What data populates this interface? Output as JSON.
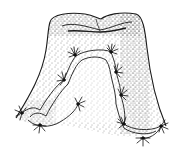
{
  "figure": {
    "colors": {
      "ink": "#1a1a1a",
      "background": "#ffffff",
      "stipple": "#333333"
    },
    "tufts": [
      {
        "x": 75,
        "y": 55
      },
      {
        "x": 111,
        "y": 52
      },
      {
        "x": 64,
        "y": 80
      },
      {
        "x": 116,
        "y": 72
      },
      {
        "x": 78,
        "y": 104
      },
      {
        "x": 121,
        "y": 95
      },
      {
        "x": 22,
        "y": 113
      },
      {
        "x": 40,
        "y": 125
      },
      {
        "x": 124,
        "y": 124
      },
      {
        "x": 143,
        "y": 138
      },
      {
        "x": 161,
        "y": 126
      }
    ]
  }
}
